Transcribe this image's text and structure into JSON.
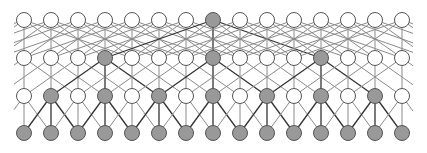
{
  "diagram": {
    "title": "",
    "width": 427,
    "height": 153,
    "node_count_per_row": 15,
    "x_start": 24,
    "x_spacing": 27,
    "radius": 7.5,
    "colors": {
      "filled": "#999999",
      "empty": "#ffffff",
      "stroke": "#555555",
      "edge": "#8a8a8a",
      "edge_highlight": "#333333"
    },
    "rows": [
      {
        "name": "layer-1",
        "y": 20,
        "filled": [
          7
        ]
      },
      {
        "name": "layer-2",
        "y": 58,
        "filled": [
          3,
          7,
          11
        ]
      },
      {
        "name": "layer-3",
        "y": 96,
        "filled": [
          1,
          3,
          5,
          7,
          9,
          11,
          13
        ]
      },
      {
        "name": "layer-4",
        "y": 133,
        "filled": [
          0,
          1,
          2,
          3,
          4,
          5,
          6,
          7,
          8,
          9,
          10,
          11,
          12,
          13,
          14
        ]
      }
    ],
    "connections": [
      {
        "from_row": 0,
        "to_row": 1,
        "offsets": [
          -4,
          -2,
          0,
          2,
          4
        ]
      },
      {
        "from_row": 1,
        "to_row": 2,
        "offsets": [
          -2,
          0,
          2
        ]
      },
      {
        "from_row": 2,
        "to_row": 3,
        "offsets": [
          -1,
          0,
          1
        ]
      }
    ]
  }
}
